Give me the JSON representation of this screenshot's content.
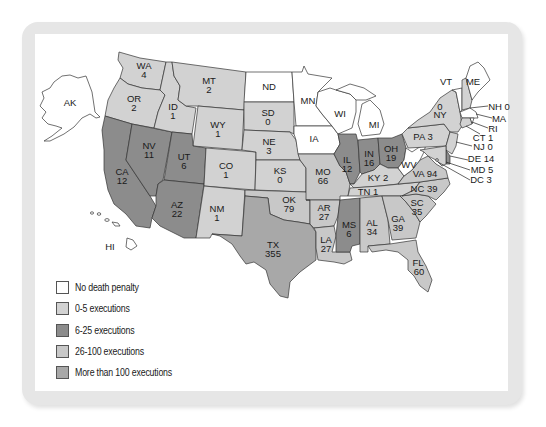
{
  "legend": {
    "items": [
      {
        "label": "No death penalty",
        "color": "#ffffff"
      },
      {
        "label": "0-5 executions",
        "color": "#d2d2d2"
      },
      {
        "label": "6-25 executions",
        "color": "#8c8c8c"
      },
      {
        "label": "26-100 executions",
        "color": "#c8c8c8"
      },
      {
        "label": "More than 100 executions",
        "color": "#a8a8a8"
      }
    ]
  },
  "states": {
    "AK": {
      "name": "AK",
      "value": "",
      "category": "none"
    },
    "HI": {
      "name": "HI",
      "value": "",
      "category": "none"
    },
    "WA": {
      "name": "WA",
      "value": "4",
      "category": "0-5"
    },
    "OR": {
      "name": "OR",
      "value": "2",
      "category": "0-5"
    },
    "CA": {
      "name": "CA",
      "value": "12",
      "category": "6-25"
    },
    "NV": {
      "name": "NV",
      "value": "11",
      "category": "6-25"
    },
    "ID": {
      "name": "ID",
      "value": "1",
      "category": "0-5"
    },
    "MT": {
      "name": "MT",
      "value": "2",
      "category": "0-5"
    },
    "WY": {
      "name": "WY",
      "value": "1",
      "category": "0-5"
    },
    "UT": {
      "name": "UT",
      "value": "6",
      "category": "6-25"
    },
    "AZ": {
      "name": "AZ",
      "value": "22",
      "category": "6-25"
    },
    "CO": {
      "name": "CO",
      "value": "1",
      "category": "0-5"
    },
    "NM": {
      "name": "NM",
      "value": "1",
      "category": "0-5"
    },
    "ND": {
      "name": "ND",
      "value": "",
      "category": "none"
    },
    "SD": {
      "name": "SD",
      "value": "0",
      "category": "0-5"
    },
    "NE": {
      "name": "NE",
      "value": "3",
      "category": "0-5"
    },
    "KS": {
      "name": "KS",
      "value": "0",
      "category": "0-5"
    },
    "OK": {
      "name": "OK",
      "value": "79",
      "category": "26-100"
    },
    "TX": {
      "name": "TX",
      "value": "355",
      "category": ">100"
    },
    "MN": {
      "name": "MN",
      "value": "",
      "category": "none"
    },
    "IA": {
      "name": "IA",
      "value": "",
      "category": "none"
    },
    "MO": {
      "name": "MO",
      "value": "66",
      "category": "26-100"
    },
    "AR": {
      "name": "AR",
      "value": "27",
      "category": "26-100"
    },
    "LA": {
      "name": "LA",
      "value": "27",
      "category": "26-100"
    },
    "WI": {
      "name": "WI",
      "value": "",
      "category": "none"
    },
    "IL": {
      "name": "IL",
      "value": "12",
      "category": "6-25"
    },
    "MI": {
      "name": "MI",
      "value": "",
      "category": "none"
    },
    "IN": {
      "name": "IN",
      "value": "16",
      "category": "6-25"
    },
    "OH": {
      "name": "OH",
      "value": "19",
      "category": "6-25"
    },
    "KY": {
      "name": "KY",
      "value": "2",
      "category": "0-5"
    },
    "TN": {
      "name": "TN",
      "value": "1",
      "category": "0-5"
    },
    "MS": {
      "name": "MS",
      "value": "6",
      "category": "6-25"
    },
    "AL": {
      "name": "AL",
      "value": "34",
      "category": "26-100"
    },
    "GA": {
      "name": "GA",
      "value": "39",
      "category": "26-100"
    },
    "FL": {
      "name": "FL",
      "value": "60",
      "category": "26-100"
    },
    "SC": {
      "name": "SC",
      "value": "35",
      "category": "26-100"
    },
    "NC": {
      "name": "NC",
      "value": "39",
      "category": "26-100"
    },
    "VA": {
      "name": "VA",
      "value": "94",
      "category": "26-100"
    },
    "WV": {
      "name": "WV",
      "value": "",
      "category": "none"
    },
    "PA": {
      "name": "PA",
      "value": "3",
      "category": "0-5"
    },
    "NY": {
      "name": "NY",
      "value": "0",
      "category": "0-5"
    },
    "VT": {
      "name": "VT",
      "value": "",
      "category": "none"
    },
    "ME": {
      "name": "ME",
      "value": "",
      "category": "none"
    },
    "NH": {
      "name": "NH",
      "value": "0",
      "category": "0-5"
    },
    "MA": {
      "name": "MA",
      "value": "",
      "category": "none"
    },
    "RI": {
      "name": "RI",
      "value": "",
      "category": "none"
    },
    "CT": {
      "name": "CT",
      "value": "1",
      "category": "0-5"
    },
    "NJ": {
      "name": "NJ",
      "value": "0",
      "category": "0-5"
    },
    "DE": {
      "name": "DE",
      "value": "14",
      "category": "6-25"
    },
    "MD": {
      "name": "MD",
      "value": "5",
      "category": "0-5"
    },
    "DC": {
      "name": "DC",
      "value": "3",
      "category": "0-5"
    }
  },
  "labels": {
    "AK": "AK",
    "HI": "HI",
    "WA_l": "WA",
    "WA_v": "4",
    "OR_l": "OR",
    "OR_v": "2",
    "CA_l": "CA",
    "CA_v": "12",
    "NV_l": "NV",
    "NV_v": "11",
    "ID_l": "ID",
    "ID_v": "1",
    "MT_l": "MT",
    "MT_v": "2",
    "WY_l": "WY",
    "WY_v": "1",
    "UT_l": "UT",
    "UT_v": "6",
    "AZ_l": "AZ",
    "AZ_v": "22",
    "CO_l": "CO",
    "CO_v": "1",
    "NM_l": "NM",
    "NM_v": "1",
    "ND": "ND",
    "SD_l": "SD",
    "SD_v": "0",
    "NE_l": "NE",
    "NE_v": "3",
    "KS_l": "KS",
    "KS_v": "0",
    "OK_l": "OK",
    "OK_v": "79",
    "TX_l": "TX",
    "TX_v": "355",
    "MN": "MN",
    "IA": "IA",
    "MO_l": "MO",
    "MO_v": "66",
    "AR_l": "AR",
    "AR_v": "27",
    "LA_l": "LA",
    "LA_v": "27",
    "WI": "WI",
    "IL_l": "IL",
    "IL_v": "12",
    "MI": "MI",
    "IN_l": "IN",
    "IN_v": "16",
    "OH_l": "OH",
    "OH_v": "19",
    "KY": "KY 2",
    "TN": "TN 1",
    "MS_l": "MS",
    "MS_v": "6",
    "AL_l": "AL",
    "AL_v": "34",
    "GA_l": "GA",
    "GA_v": "39",
    "FL_l": "FL",
    "FL_v": "60",
    "SC_l": "SC",
    "SC_v": "35",
    "NC": "NC 39",
    "VA": "VA 94",
    "WV": "WV",
    "PA": "PA 3",
    "NY_v": "0",
    "NY_l": "NY",
    "VT": "VT",
    "ME": "ME",
    "NH": "NH 0",
    "MA": "MA",
    "RI": "RI",
    "CT": "CT 1",
    "NJ": "NJ 0",
    "DE": "DE 14",
    "MD": "MD 5",
    "DC": "DC 3"
  }
}
